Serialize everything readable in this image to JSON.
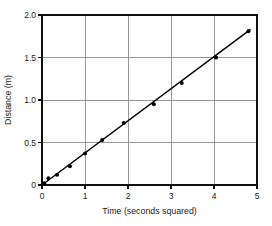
{
  "chart_data": {
    "type": "scatter",
    "title": "",
    "xlabel": "Time (seconds squared)",
    "ylabel": "Distance (m)",
    "xlim": [
      0,
      5
    ],
    "ylim": [
      0,
      2.0
    ],
    "xticks": [
      "0",
      "1",
      "2",
      "3",
      "4",
      "5"
    ],
    "xtick_values": [
      0,
      1,
      2,
      3,
      4,
      5
    ],
    "yticks": [
      "0",
      "0.5",
      "1.0",
      "1.5",
      "2.0"
    ],
    "ytick_values": [
      0,
      0.5,
      1.0,
      1.5,
      2.0
    ],
    "grid": true,
    "legend": false,
    "series": [
      {
        "name": "Measured distance",
        "marker": "filled-circle",
        "color": "#000000",
        "points": [
          {
            "x": 0.05,
            "y": 0.02
          },
          {
            "x": 0.15,
            "y": 0.08
          },
          {
            "x": 0.35,
            "y": 0.12
          },
          {
            "x": 0.65,
            "y": 0.22
          },
          {
            "x": 1.0,
            "y": 0.37
          },
          {
            "x": 1.4,
            "y": 0.53
          },
          {
            "x": 1.9,
            "y": 0.73
          },
          {
            "x": 2.6,
            "y": 0.95
          },
          {
            "x": 3.25,
            "y": 1.2
          },
          {
            "x": 4.05,
            "y": 1.5
          },
          {
            "x": 4.8,
            "y": 1.81
          }
        ]
      }
    ],
    "fit_line": {
      "name": "Best fit line",
      "type": "linear",
      "slope": 0.3771,
      "intercept": 0.0,
      "x_start": 0.0,
      "y_start": 0.0,
      "x_end": 4.85,
      "y_end": 1.83,
      "color": "#000000"
    }
  },
  "axes": {
    "x_title": "Time (seconds squared)",
    "y_title": "Distance (m)"
  },
  "labels": {
    "x": [
      "0",
      "1",
      "2",
      "3",
      "4",
      "5"
    ],
    "y": [
      "0",
      "0.5",
      "1.0",
      "1.5",
      "2.0"
    ]
  }
}
